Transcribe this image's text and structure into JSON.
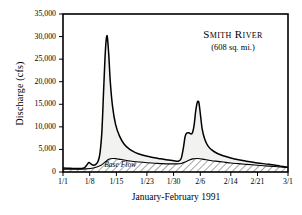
{
  "chart_data": {
    "type": "area",
    "title": "Smith River",
    "subtitle": "(608 sq. mi.)",
    "xlabel": "January-February 1991",
    "ylabel": "Discharge (cfs)",
    "ylim": [
      0,
      35000
    ],
    "ytick_labels": [
      "35,000",
      "30,000",
      "25,000",
      "20,000",
      "15,000",
      "10,000",
      "5,000",
      "0"
    ],
    "ytick_values": [
      35000,
      30000,
      25000,
      20000,
      15000,
      10000,
      5000,
      0
    ],
    "xtick_labels": [
      "1/1",
      "1/8",
      "1/15",
      "1/23",
      "1/30",
      "2/6",
      "2/14",
      "2/21",
      "3/1"
    ],
    "xtick_days": [
      0,
      7,
      14,
      22,
      29,
      36,
      44,
      51,
      59
    ],
    "xlim_days": [
      0,
      59
    ],
    "grid": false,
    "legend": false,
    "annotations": [
      {
        "text": "Base Flow",
        "day": 14.5,
        "value": 1800
      }
    ],
    "series": [
      {
        "name": "Total Discharge",
        "fill": "#f2f2f0",
        "x": [
          0,
          2,
          4,
          5.5,
          6.2,
          6.8,
          7.4,
          8.0,
          8.6,
          9.2,
          9.7,
          10.2,
          10.6,
          11.0,
          11.3,
          11.6,
          12.0,
          12.4,
          13.0,
          13.8,
          14.8,
          16.0,
          17.5,
          19.0,
          21.0,
          23.0,
          25.0,
          27.0,
          29.0,
          30.2,
          31.0,
          31.6,
          32.0,
          32.4,
          33.0,
          33.6,
          34.0,
          34.4,
          34.8,
          35.2,
          35.6,
          36.0,
          36.5,
          37.2,
          38.0,
          39.0,
          40.5,
          42.0,
          44.0,
          46.0,
          48.0,
          51.0,
          54.0,
          57.0,
          59.0
        ],
        "y": [
          900,
          820,
          760,
          900,
          1500,
          2100,
          1750,
          1500,
          1700,
          2400,
          4200,
          9000,
          17000,
          25000,
          29000,
          30100,
          26000,
          20000,
          14500,
          10500,
          8000,
          6200,
          5000,
          4300,
          3700,
          3300,
          3000,
          2700,
          2500,
          2400,
          3000,
          5500,
          7800,
          8600,
          8700,
          8400,
          8800,
          10500,
          13500,
          15400,
          15500,
          13000,
          9500,
          7200,
          5800,
          4900,
          4100,
          3600,
          3100,
          2700,
          2400,
          2000,
          1700,
          1300,
          1050
        ]
      },
      {
        "name": "Base Flow",
        "hatched": true,
        "x": [
          0,
          3,
          6,
          8,
          10,
          11,
          12,
          13,
          14,
          15,
          16,
          18,
          20,
          22,
          24,
          26,
          28,
          30,
          31,
          32,
          33,
          34,
          35,
          36,
          37,
          38,
          39,
          40,
          42,
          44,
          46,
          48,
          51,
          54,
          57,
          59
        ],
        "y": [
          600,
          620,
          700,
          900,
          1500,
          2200,
          2800,
          3000,
          2950,
          2800,
          2650,
          2400,
          2200,
          2050,
          1950,
          1850,
          1800,
          1800,
          1900,
          2200,
          2600,
          2900,
          3000,
          2950,
          2800,
          2650,
          2500,
          2400,
          2200,
          2000,
          1850,
          1700,
          1500,
          1300,
          1100,
          1000
        ]
      }
    ]
  }
}
